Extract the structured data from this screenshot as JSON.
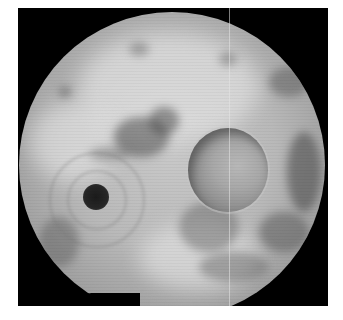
{
  "image": {
    "description": "Grayscale circular endoscopic view inside a black square frame",
    "colors": {
      "background": "#ffffff",
      "frame": "#000000",
      "tissue_light": "#c9c9c9",
      "tissue_mid": "#9a9a9a",
      "tissue_dark_patch": "#6a6a6a",
      "opening_dark": "#1b1b1b"
    },
    "features": [
      {
        "name": "dark-opening",
        "shape": "circle",
        "center": [
          96,
          197
        ],
        "radius": 13
      },
      {
        "name": "round-lesion",
        "shape": "ellipse",
        "center": [
          228,
          170
        ],
        "radius": [
          40,
          42
        ]
      },
      {
        "name": "scope-field",
        "shape": "circle",
        "center": [
          172,
          165
        ],
        "radius": 153
      },
      {
        "name": "bottom-notch",
        "shape": "wedge",
        "position": [
          130,
          290
        ]
      }
    ]
  },
  "caption": {
    "text": ""
  }
}
